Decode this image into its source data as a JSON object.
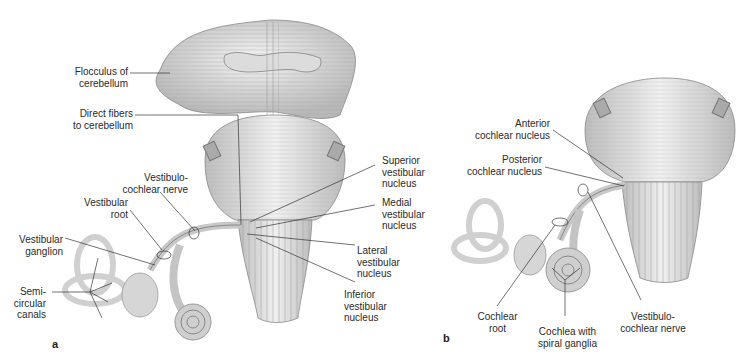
{
  "figure": {
    "panel_a": {
      "letter": "a",
      "labels": {
        "flocculus": [
          "Flocculus of",
          "cerebellum"
        ],
        "direct_fibers": [
          "Direct fibers",
          "to cerebellum"
        ],
        "vestibulocochlear_nerve": [
          "Vestibulo-",
          "cochlear nerve"
        ],
        "vestibular_root": [
          "Vestibular",
          "root"
        ],
        "vestibular_ganglion": [
          "Vestibular",
          "ganglion"
        ],
        "semicircular_canals": [
          "Semi-",
          "circular",
          "canals"
        ],
        "superior_nucleus": [
          "Superior",
          "vestibular",
          "nucleus"
        ],
        "medial_nucleus": [
          "Medial",
          "vestibular",
          "nucleus"
        ],
        "lateral_nucleus": [
          "Lateral",
          "vestibular",
          "nucleus"
        ],
        "inferior_nucleus": [
          "Inferior",
          "vestibular",
          "nucleus"
        ]
      }
    },
    "panel_b": {
      "letter": "b",
      "labels": {
        "anterior_cochlear": [
          "Anterior",
          "cochlear nucleus"
        ],
        "posterior_cochlear": [
          "Posterior",
          "cochlear nucleus"
        ],
        "cochlear_root": [
          "Cochlear",
          "root"
        ],
        "cochlea": [
          "Cochlea with",
          "spiral ganglia"
        ],
        "vestibulocochlear_nerve": [
          "Vestibulo-",
          "cochlear nerve"
        ]
      }
    }
  }
}
